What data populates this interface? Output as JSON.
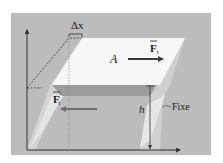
{
  "figure": {
    "labels": {
      "delta_x": "Δx",
      "area": "A",
      "force_top": "F",
      "force_top_sub": "t",
      "force_bottom": "F",
      "force_bottom_prime": "′",
      "force_bottom_sub": "t",
      "height": "h",
      "fixed": "Fixe"
    },
    "colors": {
      "panel_bg": "#bcbcbc",
      "top_face": "#f7f7f7",
      "front_band": "#9c9c9c",
      "side_light": "#d9d9d9",
      "side_lighter": "#e6e6e6",
      "axis": "#333333",
      "force_arrow_top": "#3a3a3a",
      "force_arrow_bottom": "#6e6e6e"
    }
  }
}
